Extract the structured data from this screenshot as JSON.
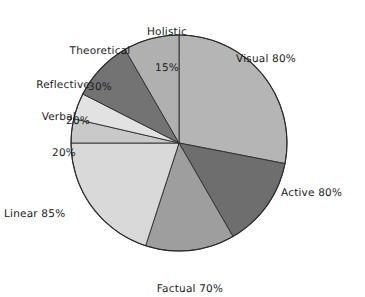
{
  "chart_data": {
    "type": "pie",
    "title": "",
    "subtitle": "",
    "xlabel": "",
    "ylabel": "",
    "legend_position": "none",
    "grid": false,
    "note": "Learning-style profile pie chart, grayscale hand-drawn style. Percentage values are independent trait scores shown in the labels; slice angles are proportional to those scores.",
    "total_percent": 320,
    "categories": [
      "Visual 80%",
      "Active 80%",
      "Factual 70%",
      "Linear 85%",
      "Verbal 20%",
      "Reflective 20%",
      "Theoretical 30%",
      "Holistic 15%"
    ],
    "values": [
      80,
      80,
      70,
      85,
      20,
      20,
      30,
      15
    ],
    "labels": [
      "Visual 80%",
      "Active 80%",
      "Factual 70%",
      "Linear 85%",
      "Verbal 20%",
      "Reflective 20%",
      "Theoretical 30%",
      "Holistic 15%"
    ],
    "colors": [
      "#b5b5b5",
      "#6e6e6e",
      "#9e9e9e",
      "#d9d9d9",
      "#c9c9c9",
      "#e2e2e2",
      "#737373",
      "#b0b0b0"
    ],
    "slices": [
      {
        "name": "Visual",
        "percent_label": "80%",
        "value": 80,
        "color": "#b5b5b5",
        "start_deg": 0,
        "end_deg": 101
      },
      {
        "name": "Active",
        "percent_label": "80%",
        "value": 80,
        "color": "#6e6e6e",
        "start_deg": 101,
        "end_deg": 150
      },
      {
        "name": "Factual",
        "percent_label": "70%",
        "value": 70,
        "color": "#9e9e9e",
        "start_deg": 150,
        "end_deg": 198
      },
      {
        "name": "Linear",
        "percent_label": "85%",
        "value": 85,
        "color": "#d9d9d9",
        "start_deg": 198,
        "end_deg": 270
      },
      {
        "name": "Verbal",
        "percent_label": "20%",
        "value": 20,
        "color": "#c9c9c9",
        "start_deg": 270,
        "end_deg": 283
      },
      {
        "name": "Reflective",
        "percent_label": "20%",
        "value": 20,
        "color": "#e2e2e2",
        "start_deg": 283,
        "end_deg": 297
      },
      {
        "name": "Theoretical",
        "percent_label": "30%",
        "value": 30,
        "color": "#737373",
        "start_deg": 297,
        "end_deg": 330
      },
      {
        "name": "Holistic",
        "percent_label": "15%",
        "value": 15,
        "color": "#b0b0b0",
        "start_deg": 330,
        "end_deg": 360
      }
    ],
    "geometry": {
      "cx": 179,
      "cy": 143,
      "radius": 108,
      "start_angle_deg": 0,
      "direction": "clockwise"
    },
    "style": {
      "stroke": "#2b2b2b",
      "stroke_width": 0.9,
      "background": "#ffffff"
    }
  },
  "labels": {
    "visual": {
      "line1": "Visual 80%"
    },
    "active": {
      "line1": "Active 80%"
    },
    "factual": {
      "line1": "Factual 70%"
    },
    "linear": {
      "line1": "Linear 85%"
    },
    "verbal": {
      "line1": "Verbal",
      "line2": "20%"
    },
    "reflective": {
      "line1": "Reflective",
      "line2": "20%"
    },
    "theoretical": {
      "line1": "Theoretical",
      "line2": "30%"
    },
    "holistic": {
      "line1": "Holistic",
      "line2": "15%"
    }
  }
}
